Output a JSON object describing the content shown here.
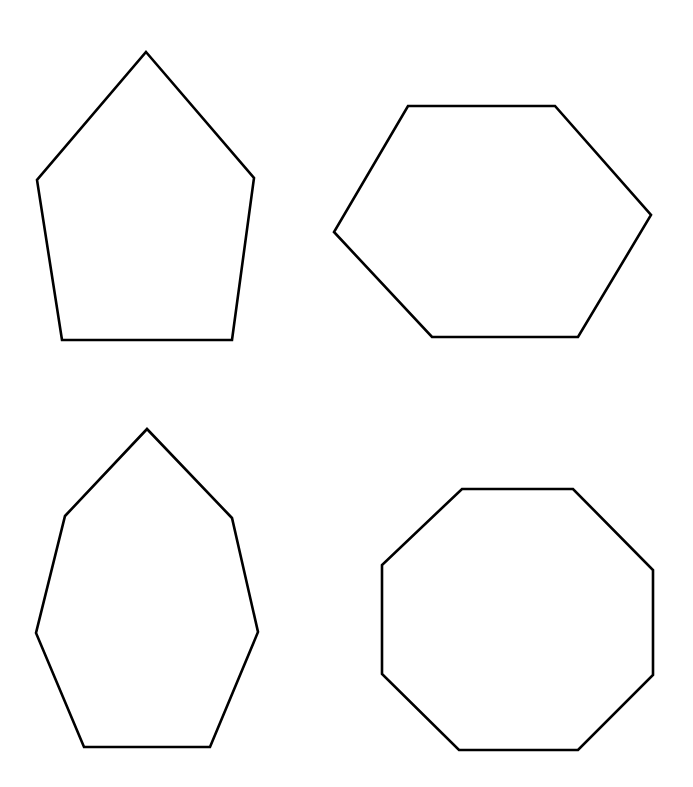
{
  "page": {
    "width": 693,
    "height": 787,
    "background_color": "#ffffff",
    "stroke_color": "#000000",
    "fill_color": "#ffffff",
    "stroke_width": 2.6
  },
  "shapes": [
    {
      "id": "pentagon",
      "name": "pentagon",
      "sides": 5,
      "position": "top-left",
      "points": "146,52 254,178 232,340 62,340 37,180",
      "bounds": {
        "x": 36,
        "y": 51,
        "width": 219,
        "height": 290
      },
      "center": {
        "x": 146,
        "y": 210
      }
    },
    {
      "id": "hexagon",
      "name": "hexagon",
      "sides": 6,
      "position": "top-right",
      "points": "408,106 555,106 651,215 578,337 432,337 334,232",
      "bounds": {
        "x": 334,
        "y": 105,
        "width": 318,
        "height": 233
      },
      "center": {
        "x": 493,
        "y": 221
      }
    },
    {
      "id": "heptagon",
      "name": "heptagon",
      "sides": 7,
      "position": "bottom-left",
      "points": "147,429 232,518 258,632 210,747 84,747 36,633 65,516",
      "bounds": {
        "x": 36,
        "y": 428,
        "width": 223,
        "height": 320
      },
      "center": {
        "x": 147,
        "y": 588
      }
    },
    {
      "id": "octagon",
      "name": "octagon",
      "sides": 8,
      "position": "bottom-right",
      "points": "462,489 573,489 653,570 653,675 578,750 459,750 382,674 382,565",
      "bounds": {
        "x": 381,
        "y": 488,
        "width": 273,
        "height": 263
      },
      "center": {
        "x": 517,
        "y": 619
      }
    }
  ]
}
